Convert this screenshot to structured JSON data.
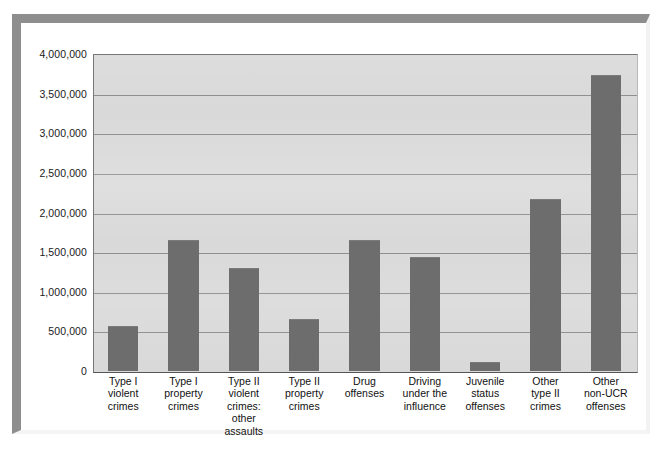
{
  "page": {
    "top_cropped_text": "",
    "background_color": "#ffffff",
    "frame_color": "#8e8e8e"
  },
  "chart_data": {
    "type": "bar",
    "title": "",
    "subtitle": "",
    "xlabel": "",
    "ylabel": "",
    "ylim": [
      0,
      4000000
    ],
    "grid": true,
    "legend": "none",
    "plot_background_color": "#d9d9d9",
    "bar_color": "#6d6d6d",
    "gridline_color": "#8c8c8c",
    "y_ticks": [
      0,
      500000,
      1000000,
      1500000,
      2000000,
      2500000,
      3000000,
      3500000,
      4000000
    ],
    "y_tick_labels": [
      "0",
      "500,000",
      "1,000,000",
      "1,500,000",
      "2,000,000",
      "2,500,000",
      "3,000,000",
      "3,500,000",
      "4,000,000"
    ],
    "categories": [
      "Type I violent crimes",
      "Type I property crimes",
      "Type II violent crimes: other assaults",
      "Type II property crimes",
      "Drug offenses",
      "Driving under the influence",
      "Juvenile status offenses",
      "Other type II crimes",
      "Other non-UCR offenses"
    ],
    "category_label_lines": [
      [
        "Type I",
        "violent",
        "crimes"
      ],
      [
        "Type I",
        "property",
        "crimes"
      ],
      [
        "Type II",
        "violent",
        "crimes:",
        "other",
        "assaults"
      ],
      [
        "Type II",
        "property",
        "crimes"
      ],
      [
        "Drug",
        "offenses"
      ],
      [
        "Driving",
        "under the",
        "influence"
      ],
      [
        "Juvenile",
        "status",
        "offenses"
      ],
      [
        "Other",
        "type II",
        "crimes"
      ],
      [
        "Other",
        "non-UCR",
        "offenses"
      ]
    ],
    "values": [
      565000,
      1650000,
      1300000,
      655000,
      1650000,
      1435000,
      120000,
      2165000,
      3740000
    ]
  }
}
